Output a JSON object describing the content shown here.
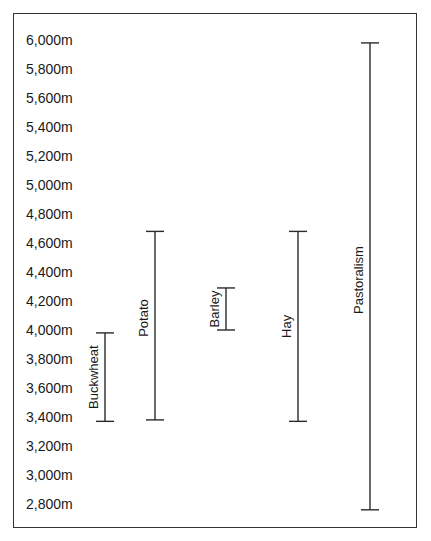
{
  "chart_data": {
    "type": "range",
    "title": "",
    "xlabel": "",
    "ylabel": "Altitude",
    "ylim": [
      2800,
      6000
    ],
    "y_ticks": [
      "6,000m",
      "5,800m",
      "5,600m",
      "5,400m",
      "5,200m",
      "5,000m",
      "4,800m",
      "4,600m",
      "4,400m",
      "4,200m",
      "4,000m",
      "3,800m",
      "3,600m",
      "3,400m",
      "3,200m",
      "3,000m",
      "2,800m"
    ],
    "y_tick_values": [
      6000,
      5800,
      5600,
      5400,
      5200,
      5000,
      4800,
      4600,
      4400,
      4200,
      4000,
      3800,
      3600,
      3400,
      3200,
      3000,
      2800
    ],
    "grid": false,
    "legend": null,
    "categories": [
      "Buckwheat",
      "Potato",
      "Barley",
      "Hay",
      "Pastoralism"
    ],
    "series": [
      {
        "name": "Buckwheat",
        "low": 3370,
        "high": 3980
      },
      {
        "name": "Potato",
        "low": 3380,
        "high": 4680
      },
      {
        "name": "Barley",
        "low": 4000,
        "high": 4290
      },
      {
        "name": "Hay",
        "low": 3370,
        "high": 4680
      },
      {
        "name": "Pastoralism",
        "low": 2760,
        "high": 5980
      }
    ]
  },
  "colors": {
    "line": "#2a2a2a",
    "frame": "#333333",
    "text": "#1a1a1a",
    "background": "#ffffff"
  }
}
